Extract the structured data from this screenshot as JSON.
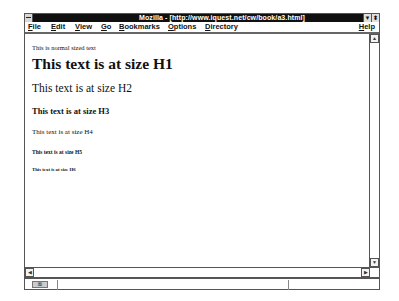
{
  "window": {
    "title": "Mozilla - [http://www.iquest.net/cw/book/a3.html]",
    "minimize_glyph": "▼",
    "restore_glyph": "⬍"
  },
  "menubar": {
    "items": [
      {
        "label": "File",
        "mnemonic": "F",
        "rest": "ile"
      },
      {
        "label": "Edit",
        "mnemonic": "E",
        "rest": "dit"
      },
      {
        "label": "View",
        "mnemonic": "V",
        "rest": "iew"
      },
      {
        "label": "Go",
        "mnemonic": "G",
        "rest": "o"
      },
      {
        "label": "Bookmarks",
        "mnemonic": "B",
        "rest": "ookmarks"
      },
      {
        "label": "Options",
        "mnemonic": "O",
        "rest": "ptions"
      },
      {
        "label": "Directory",
        "mnemonic": "D",
        "rest": "irectory"
      },
      {
        "label": "Help",
        "mnemonic": "H",
        "rest": "elp"
      }
    ]
  },
  "content": {
    "normal": "This is normal sized text",
    "h1": "This text is at size H1",
    "h2": "This text is at size H2",
    "h3": "This text is at size H3",
    "h4": "This text is at size H4",
    "h5": "This text is at size H5",
    "h6": "This text is at size H6"
  },
  "scrollbars": {
    "up_glyph": "▲",
    "down_glyph": "▼",
    "left_glyph": "◀",
    "right_glyph": "▶"
  },
  "statusbar": {
    "security_icon_glyph": "⚿"
  }
}
